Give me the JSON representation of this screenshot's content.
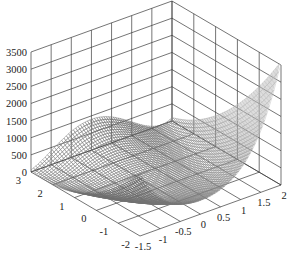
{
  "chart_data": {
    "type": "surface3d",
    "title": "",
    "function": "z = 100*(y - x^2)^2 + (1 - x)^2",
    "x_axis": {
      "label": "",
      "range": [
        -1.5,
        2
      ],
      "ticks": [
        "-1.5",
        "-1",
        "-0.5",
        "0",
        "0.5",
        "1",
        "1.5",
        "2"
      ]
    },
    "y_axis": {
      "label": "",
      "range": [
        -2,
        3
      ],
      "ticks": [
        "-2",
        "-1",
        "0",
        "1",
        "2",
        "3"
      ]
    },
    "z_axis": {
      "label": "",
      "range": [
        0,
        3500
      ],
      "ticks": [
        "0",
        "500",
        "1000",
        "1500",
        "2000",
        "2500",
        "3000",
        "3500"
      ]
    },
    "grid": true,
    "legend": null,
    "colormap": "grayscale",
    "mesh_resolution": 60
  },
  "style": {
    "grid_color": "#3a3a3a",
    "surface_dark": "#4a4a4a",
    "surface_light": "#d8d8d8"
  }
}
